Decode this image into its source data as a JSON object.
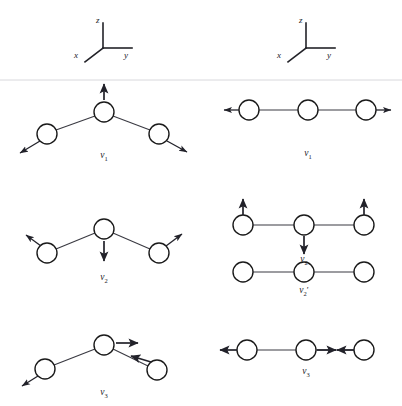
{
  "figure": {
    "background_color": "#ffffff",
    "atom_fill": "#ffffff",
    "atom_stroke": "#1a1a1a",
    "bond_color": "#3a3a42",
    "arrow_color": "#22222a",
    "rule_color": "#d8d8dc"
  },
  "axes": {
    "left": {
      "name": "axis-legend-bent-molecule",
      "z_label": "z",
      "y_label": "y",
      "x_label": "x"
    },
    "right": {
      "name": "axis-legend-linear-molecule",
      "z_label": "z",
      "y_label": "y",
      "x_label": "x"
    }
  },
  "columns": {
    "left": {
      "title": "bent triatomic molecule normal modes",
      "geometry": "bent"
    },
    "right": {
      "title": "linear triatomic molecule normal modes",
      "geometry": "linear"
    }
  },
  "modes": {
    "bent_v1": {
      "label_base": "ν",
      "label_sub": "1",
      "label_prime": "",
      "label_full": "ν1",
      "description": "symmetric stretch of bent molecule",
      "atoms": [
        {
          "name": "atom-left",
          "cx": 47,
          "cy": 134,
          "r": 10
        },
        {
          "name": "atom-center",
          "cx": 104,
          "cy": 112,
          "r": 10
        },
        {
          "name": "atom-right",
          "cx": 159,
          "cy": 134,
          "r": 10
        }
      ],
      "arrows": [
        {
          "name": "arrow-left-atom",
          "x1": 40,
          "y1": 141,
          "x2": 18,
          "y2": 154
        },
        {
          "name": "arrow-center-atom",
          "x1": 104,
          "y1": 100,
          "x2": 104,
          "y2": 82
        },
        {
          "name": "arrow-right-atom",
          "x1": 167,
          "y1": 141,
          "x2": 189,
          "y2": 153
        }
      ]
    },
    "linear_v1": {
      "label_base": "ν",
      "label_sub": "1",
      "label_prime": "",
      "label_full": "ν1",
      "description": "symmetric stretch of linear molecule",
      "atoms": [
        {
          "name": "atom-left",
          "cx": 249,
          "cy": 110,
          "r": 10
        },
        {
          "name": "atom-center",
          "cx": 308,
          "cy": 110,
          "r": 10
        },
        {
          "name": "atom-right",
          "cx": 366,
          "cy": 110,
          "r": 10
        }
      ],
      "arrows": [
        {
          "name": "arrow-left-atom",
          "x1": 239,
          "y1": 110,
          "x2": 222,
          "y2": 110
        },
        {
          "name": "arrow-right-atom",
          "x1": 376,
          "y1": 110,
          "x2": 393,
          "y2": 110
        }
      ]
    },
    "bent_v2": {
      "label_base": "ν",
      "label_sub": "2",
      "label_prime": "",
      "label_full": "ν2",
      "description": "bending mode of bent molecule",
      "atoms": [
        {
          "name": "atom-left",
          "cx": 47,
          "cy": 253,
          "r": 10
        },
        {
          "name": "atom-center",
          "cx": 104,
          "cy": 229,
          "r": 10
        },
        {
          "name": "atom-right",
          "cx": 159,
          "cy": 253,
          "r": 10
        }
      ],
      "arrows": [
        {
          "name": "arrow-left-atom",
          "x1": 40,
          "y1": 246,
          "x2": 24,
          "y2": 234
        },
        {
          "name": "arrow-center-atom",
          "x1": 104,
          "y1": 241,
          "x2": 104,
          "y2": 263
        },
        {
          "name": "arrow-right-atom",
          "x1": 167,
          "y1": 246,
          "x2": 184,
          "y2": 233
        }
      ]
    },
    "linear_v2": {
      "label_base": "ν",
      "label_sub": "2",
      "label_prime": "",
      "label_full": "ν2",
      "description": "in-plane degenerate bending mode of linear molecule",
      "atoms": [
        {
          "name": "atom-left",
          "cx": 243,
          "cy": 225,
          "r": 10
        },
        {
          "name": "atom-center",
          "cx": 304,
          "cy": 225,
          "r": 10
        },
        {
          "name": "atom-right",
          "cx": 364,
          "cy": 225,
          "r": 10
        }
      ],
      "arrows": [
        {
          "name": "arrow-left-atom",
          "x1": 243,
          "y1": 215,
          "x2": 243,
          "y2": 197
        },
        {
          "name": "arrow-center-atom",
          "x1": 304,
          "y1": 236,
          "x2": 304,
          "y2": 256
        },
        {
          "name": "arrow-right-atom",
          "x1": 364,
          "y1": 215,
          "x2": 364,
          "y2": 197
        }
      ]
    },
    "linear_v2_prime": {
      "label_base": "ν",
      "label_sub": "2",
      "label_prime": "′",
      "label_full": "ν2′",
      "description": "out-of-plane degenerate bending mode of linear molecule",
      "atoms": [
        {
          "name": "atom-left",
          "cx": 243,
          "cy": 272,
          "r": 10
        },
        {
          "name": "atom-center",
          "cx": 304,
          "cy": 272,
          "r": 10
        },
        {
          "name": "atom-right",
          "cx": 364,
          "cy": 272,
          "r": 10
        }
      ],
      "arrows": []
    },
    "bent_v3": {
      "label_base": "ν",
      "label_sub": "3",
      "label_prime": "",
      "label_full": "ν3",
      "description": "antisymmetric stretch of bent molecule",
      "atoms": [
        {
          "name": "atom-left",
          "cx": 45,
          "cy": 369,
          "r": 10
        },
        {
          "name": "atom-center",
          "cx": 104,
          "cy": 345,
          "r": 10
        },
        {
          "name": "atom-right",
          "cx": 157,
          "cy": 370,
          "r": 10
        }
      ],
      "arrows": [
        {
          "name": "arrow-left-atom",
          "x1": 38,
          "y1": 376,
          "x2": 20,
          "y2": 387
        },
        {
          "name": "arrow-center-atom",
          "x1": 116,
          "y1": 343,
          "x2": 140,
          "y2": 343
        },
        {
          "name": "arrow-right-atom",
          "x1": 152,
          "y1": 362,
          "x2": 128,
          "y2": 355
        }
      ]
    },
    "linear_v3": {
      "label_base": "ν",
      "label_sub": "3",
      "label_prime": "",
      "label_full": "ν3",
      "description": "antisymmetric stretch of linear molecule",
      "atoms": [
        {
          "name": "atom-left",
          "cx": 247,
          "cy": 350,
          "r": 10
        },
        {
          "name": "atom-center",
          "cx": 306,
          "cy": 350,
          "r": 10
        },
        {
          "name": "atom-right",
          "cx": 364,
          "cy": 350,
          "r": 10
        }
      ],
      "arrows": [
        {
          "name": "arrow-left-atom",
          "x1": 237,
          "y1": 350,
          "x2": 218,
          "y2": 350
        },
        {
          "name": "arrow-center-atom",
          "x1": 317,
          "y1": 350,
          "x2": 338,
          "y2": 350
        },
        {
          "name": "arrow-right-atom",
          "x1": 354,
          "y1": 350,
          "x2": 335,
          "y2": 350
        }
      ]
    }
  }
}
